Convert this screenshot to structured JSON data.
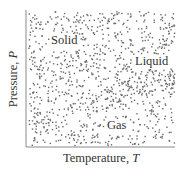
{
  "diagram": {
    "type": "phase-diagram",
    "style": "stippled dots (density indicates phase)",
    "x_axis": {
      "title": "Temperature, ",
      "variable": "T"
    },
    "y_axis": {
      "title": "Pressure, ",
      "variable": "P"
    },
    "regions": [
      {
        "id": "solid",
        "label": "Solid",
        "position": "upper-left",
        "density": "medium"
      },
      {
        "id": "liquid",
        "label": "Liquid",
        "position": "center-right wedge",
        "density": "high"
      },
      {
        "id": "gas",
        "label": "Gas",
        "position": "bottom",
        "density": "low-medium"
      }
    ],
    "colors": {
      "dots": "#6b6b6b",
      "axes": "#8a8a8a",
      "text": "#333333",
      "background": "#ffffff"
    },
    "plot_area": {
      "left": 26,
      "top": 10,
      "right": 175,
      "bottom": 147
    }
  }
}
